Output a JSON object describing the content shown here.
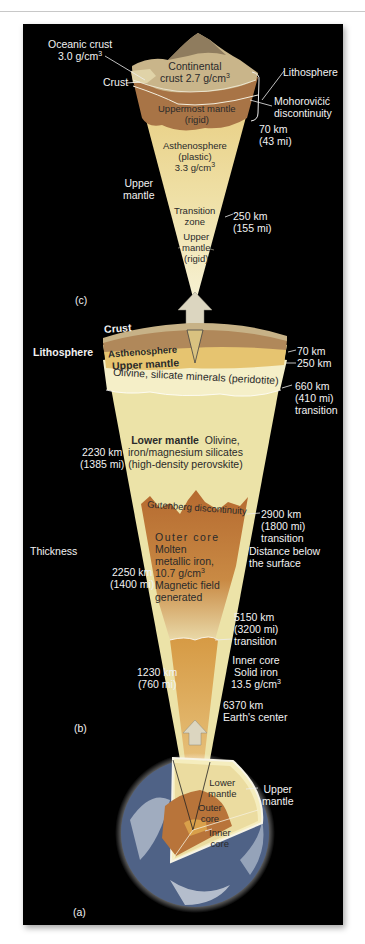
{
  "figure": {
    "panels": [
      "(c)",
      "(b)",
      "(a)"
    ],
    "colors": {
      "background": "#000000",
      "crust": "#c9b58a",
      "uppermost_mantle": "#b07a4a",
      "asthenosphere": "#e9cf86",
      "upper_mantle": "#f3ecc0",
      "lower_mantle": "#ede4a8",
      "outer_core": "#c07a3a",
      "inner_core": "#d8a04a",
      "arrow": "#d9d2b8"
    }
  },
  "panel_c": {
    "label": "(c)",
    "oceanic_crust": "Oceanic crust",
    "oceanic_density": "3.0 g/cm",
    "crust": "Crust",
    "continental_line1": "Continental",
    "continental_line2": "crust 2.7 g/cm",
    "lithosphere": "Lithosphere",
    "moho_line1": "Mohorovičić",
    "moho_line2": "discontinuity",
    "uppermost_line1": "Uppermost mantle",
    "uppermost_line2": "(rigid)",
    "depth_70": "70 km",
    "depth_70_mi": "(43 mi)",
    "astheno_line1": "Asthenosphere",
    "astheno_line2": "(plastic)",
    "astheno_line3": "3.3 g/cm",
    "upper_mantle_line1": "Upper",
    "upper_mantle_line2": "mantle",
    "transition_line1": "Transition",
    "transition_line2": "zone",
    "depth_250": "250 km",
    "depth_250_mi": "(155 mi)",
    "rigid_line1": "Upper",
    "rigid_line2": "mantle",
    "rigid_line3": "(rigid)"
  },
  "panel_b": {
    "label": "(b)",
    "crust": "Crust",
    "lithosphere": "Lithosphere",
    "asthenosphere": "Asthenosphere",
    "upper_mantle": "Upper mantle",
    "upper_mantle_desc": "Olivine, silicate minerals (peridotite)",
    "depth_70": "70 km",
    "depth_250": "250 km",
    "depth_660": "660 km",
    "depth_660_mi": "(410 mi)",
    "depth_660_note": "transition",
    "lower_mantle_title": "Lower mantle",
    "lower_mantle_line1": "Olivine,",
    "lower_mantle_line2": "iron/magnesium silicates",
    "lower_mantle_line3": "(high-density perovskite)",
    "thick_lower": "2230 km",
    "thick_lower_mi": "(1385 mi)",
    "gutenberg": "Gutenberg discontinuity",
    "depth_2900": "2900 km",
    "depth_2900_mi": "(1800 mi)",
    "depth_2900_note": "transition",
    "thickness_header": "Thickness",
    "distance_header_1": "Distance below",
    "distance_header_2": "the surface",
    "outer_core_title": "Outer core",
    "outer_core_line1": "Molten",
    "outer_core_line2": "metallic iron,",
    "outer_core_line3": "10.7 g/cm",
    "outer_core_line4": "Magnetic field",
    "outer_core_line5": "generated",
    "thick_outer": "2250 km",
    "thick_outer_mi": "(1400 mi)",
    "depth_5150": "5150 km",
    "depth_5150_mi": "(3200 mi)",
    "depth_5150_note": "transition",
    "inner_core_title": "Inner core",
    "inner_core_line1": "Solid iron",
    "inner_core_line2": "13.5 g/cm",
    "thick_inner": "1230 km",
    "thick_inner_mi": "(760 mi)",
    "depth_6370": "6370 km",
    "depth_6370_note": "Earth's center"
  },
  "panel_a": {
    "label": "(a)",
    "lower_mantle_1": "Lower",
    "lower_mantle_2": "mantle",
    "upper_mantle_1": "Upper",
    "upper_mantle_2": "mantle",
    "outer_core_1": "Outer",
    "outer_core_2": "core",
    "inner_core_1": "Inner",
    "inner_core_2": "core"
  },
  "superscript": "3"
}
